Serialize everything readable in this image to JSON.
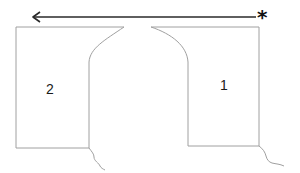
{
  "diagram": {
    "arrow": {
      "direction": "left",
      "start_marker": "*",
      "color": "#2a2a2a"
    },
    "shapes": [
      {
        "id": "right-block",
        "label": "1"
      },
      {
        "id": "left-block",
        "label": "2"
      }
    ],
    "outline_color": "#a0a0a0"
  }
}
